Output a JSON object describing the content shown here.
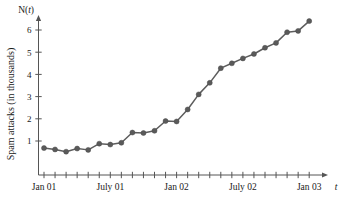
{
  "chart_data": {
    "type": "line",
    "title": "",
    "subtitle": "",
    "ylabel": "Spam attacks (in thousands)",
    "y_axis_name": "N(t)",
    "xlabel": "t",
    "x_axis_name": "t",
    "grid": false,
    "legend": null,
    "markers": true,
    "ylim": [
      0,
      6.8
    ],
    "xlim": [
      0,
      25
    ],
    "y_ticks": [
      1,
      2,
      3,
      4,
      5,
      6
    ],
    "y_tick_labels": [
      "1",
      "2",
      "3",
      "4",
      "5",
      "6"
    ],
    "x_tick_count": 25,
    "x_labeled_ticks": [
      {
        "index": 0,
        "label": "Jan 01"
      },
      {
        "index": 6,
        "label": "July 01"
      },
      {
        "index": 12,
        "label": "Jan 02"
      },
      {
        "index": 18,
        "label": "July 02"
      },
      {
        "index": 24,
        "label": "Jan 03"
      }
    ],
    "x": [
      0,
      1,
      2,
      3,
      4,
      5,
      6,
      7,
      8,
      9,
      10,
      11,
      12,
      13,
      14,
      15,
      16,
      17,
      18,
      19,
      20,
      21,
      22,
      23,
      24
    ],
    "values": [
      0.68,
      0.62,
      0.52,
      0.66,
      0.6,
      0.88,
      0.84,
      0.92,
      1.38,
      1.36,
      1.46,
      1.9,
      1.88,
      2.42,
      3.1,
      3.62,
      4.28,
      4.5,
      4.72,
      4.92,
      5.2,
      5.42,
      5.9,
      5.96,
      6.4
    ],
    "series": [
      {
        "name": "Spam attacks",
        "values": [
          0.68,
          0.62,
          0.52,
          0.66,
          0.6,
          0.88,
          0.84,
          0.92,
          1.38,
          1.36,
          1.46,
          1.9,
          1.88,
          2.42,
          3.1,
          3.62,
          4.28,
          4.5,
          4.72,
          4.92,
          5.2,
          5.42,
          5.9,
          5.96,
          6.4
        ],
        "color": "#5a5a5a"
      }
    ],
    "colors": {
      "line": "#5d5d5d",
      "marker": "#5a5a5a",
      "axis": "#555555",
      "background": "#ffffff"
    }
  }
}
